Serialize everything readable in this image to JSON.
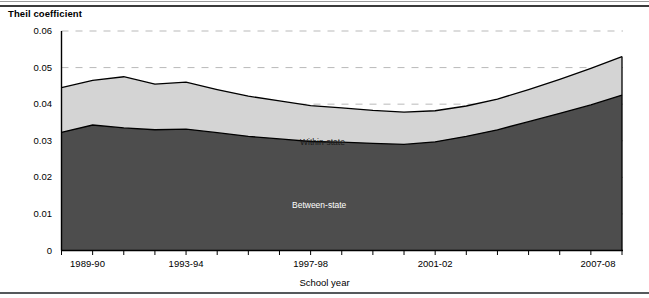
{
  "figure": {
    "y_axis_title": "Theil coefficient",
    "x_axis_title": "School year"
  },
  "series_labels": {
    "within": "Within-state",
    "between": "Between-state"
  },
  "colors": {
    "between_state_fill": "#4d4d4d",
    "within_state_fill": "#d4d4d4",
    "line": "#000000",
    "gridline": "#b9b9b9",
    "axis": "#000000",
    "top_rule": "#3a3a3a",
    "bottom_rule": "#55595c",
    "background": "#ffffff"
  },
  "chart_data": {
    "type": "area",
    "stacked": true,
    "title": "",
    "subtitle": "",
    "xlabel": "School year",
    "ylabel": "Theil coefficient",
    "ylim": [
      0,
      0.06
    ],
    "yticks": [
      "0",
      "0.01",
      "0.02",
      "0.03",
      "0.04",
      "0.05",
      "0.06"
    ],
    "ytick_values": [
      0,
      0.01,
      0.02,
      0.03,
      0.04,
      0.05,
      0.06
    ],
    "grid": "horizontal-dashed",
    "legend": "inline-annotations",
    "categories": [
      "1989-90",
      "1990-91",
      "1991-92",
      "1992-93",
      "1993-94",
      "1994-95",
      "1995-96",
      "1996-97",
      "1997-98",
      "1998-99",
      "1999-2000",
      "2000-01",
      "2001-02",
      "2002-03",
      "2003-04",
      "2004-05",
      "2005-06",
      "2006-07",
      "2007-08"
    ],
    "xtick_labels_shown": [
      "1989-90",
      "1993-94",
      "1997-98",
      "2001-02",
      "2007-08"
    ],
    "xtick_label_indices": [
      0,
      4,
      8,
      12,
      18
    ],
    "series": [
      {
        "name": "Between-state",
        "values": [
          0.0323,
          0.0343,
          0.0335,
          0.033,
          0.0332,
          0.0322,
          0.0312,
          0.0305,
          0.0298,
          0.0296,
          0.0293,
          0.029,
          0.0297,
          0.0312,
          0.033,
          0.0352,
          0.0375,
          0.0398,
          0.0425
        ]
      },
      {
        "name": "Within-state",
        "values": [
          0.0122,
          0.0122,
          0.014,
          0.0125,
          0.0128,
          0.0118,
          0.011,
          0.0104,
          0.0098,
          0.0094,
          0.009,
          0.0088,
          0.0085,
          0.0083,
          0.0084,
          0.0088,
          0.0093,
          0.01,
          0.0105
        ]
      }
    ],
    "totals": [
      0.0445,
      0.0465,
      0.0475,
      0.0455,
      0.046,
      0.044,
      0.0422,
      0.0409,
      0.0396,
      0.039,
      0.0383,
      0.0378,
      0.0382,
      0.0395,
      0.0414,
      0.044,
      0.0468,
      0.0498,
      0.053
    ]
  }
}
